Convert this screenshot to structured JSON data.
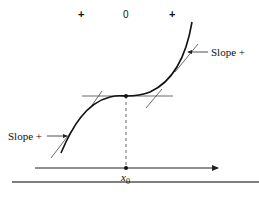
{
  "sign_row": {
    "left": "+",
    "middle": "0",
    "right": "+"
  },
  "labels": {
    "slope_right": "Slope +",
    "slope_left": "Slope +",
    "x_axis_point": "x",
    "x_axis_point_sub": "0"
  },
  "colors": {
    "curve": "#111111",
    "tangent": "#444444",
    "axis": "#222222",
    "background": "#ffffff"
  }
}
